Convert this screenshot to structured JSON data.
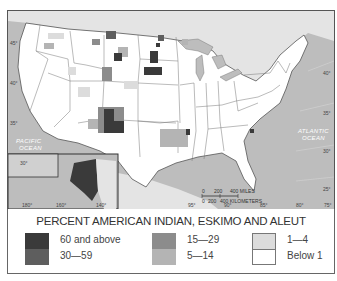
{
  "map": {
    "latitude_labels_left": [
      "45°",
      "40°",
      "35°",
      "30°"
    ],
    "latitude_labels_right": [
      "40°",
      "35°",
      "30°",
      "25°"
    ],
    "longitude_labels_bottom": [
      "95°",
      "90°",
      "85°",
      "80°",
      "75°"
    ],
    "inset_longitude_labels": [
      "180°",
      "160°",
      "140°"
    ],
    "ocean_labels": {
      "pacific": "PACIFIC\nOCEAN",
      "pacific_line1": "PACIFIC",
      "pacific_line2": "OCEAN",
      "atlantic_line1": "ATLANTIC",
      "atlantic_line2": "OCEAN"
    },
    "scale_bar": {
      "miles_ticks": [
        "0",
        "200",
        "400 MILES"
      ],
      "km_ticks": [
        "0",
        "200",
        "400 KILOMETERS"
      ]
    },
    "colors": {
      "ocean": "#bdbdbd",
      "land_us": "#ffffff",
      "land_neighbors": "#e2e2e2",
      "borders": "#555555"
    }
  },
  "legend": {
    "title": "PERCENT AMERICAN INDIAN, ESKIMO AND ALEUT",
    "items": [
      {
        "label": "60 and above",
        "color": "#3a3a3a"
      },
      {
        "label": "30—59",
        "color": "#5e5e5e"
      },
      {
        "label": "15—29",
        "color": "#8c8c8c"
      },
      {
        "label": "5—14",
        "color": "#b4b4b4"
      },
      {
        "label": "1—4",
        "color": "#dcdcdc"
      },
      {
        "label": "Below 1",
        "color": "#ffffff"
      }
    ]
  }
}
